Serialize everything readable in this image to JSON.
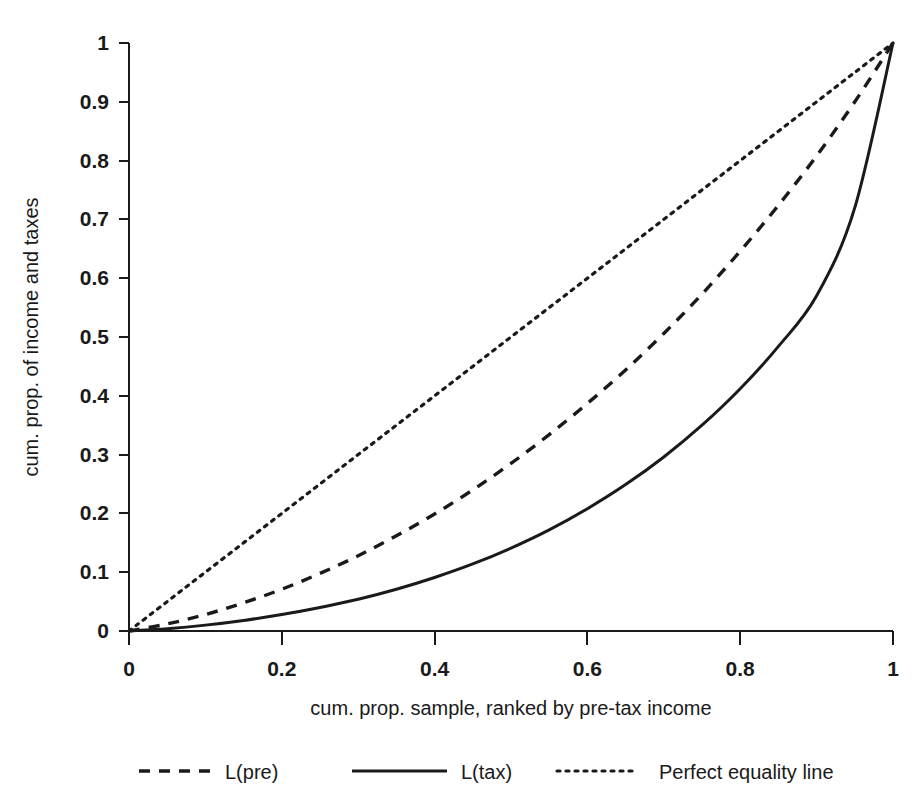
{
  "chart_data": {
    "type": "line",
    "title": "",
    "subtitle": "",
    "xlabel": "cum. prop. sample, ranked by pre-tax income",
    "ylabel": "cum. prop. of income and taxes",
    "xlim": [
      0,
      1
    ],
    "ylim": [
      0,
      1
    ],
    "grid": false,
    "legend_position": "bottom",
    "xticks": [
      "0",
      "0.2",
      "0.4",
      "0.6",
      "0.8",
      "1"
    ],
    "xtick_values": [
      0,
      0.2,
      0.4,
      0.6,
      0.8,
      1
    ],
    "yticks": [
      "0",
      "0.1",
      "0.2",
      "0.3",
      "0.4",
      "0.5",
      "0.6",
      "0.7",
      "0.8",
      "0.9",
      "1"
    ],
    "ytick_values": [
      0,
      0.1,
      0.2,
      0.3,
      0.4,
      0.5,
      0.6,
      0.7,
      0.8,
      0.9,
      1
    ],
    "x": [
      0,
      0.05,
      0.1,
      0.15,
      0.2,
      0.25,
      0.3,
      0.35,
      0.4,
      0.45,
      0.5,
      0.55,
      0.6,
      0.65,
      0.7,
      0.75,
      0.8,
      0.85,
      0.9,
      0.95,
      1
    ],
    "series": [
      {
        "name": "L(pre)",
        "style": "dashed",
        "color": "#1a1a1a",
        "values": [
          0,
          0.012,
          0.028,
          0.048,
          0.071,
          0.098,
          0.128,
          0.162,
          0.199,
          0.24,
          0.285,
          0.334,
          0.387,
          0.444,
          0.506,
          0.573,
          0.646,
          0.724,
          0.808,
          0.9,
          1
        ]
      },
      {
        "name": "L(tax)",
        "style": "solid",
        "color": "#1a1a1a",
        "values": [
          0,
          0.004,
          0.01,
          0.018,
          0.028,
          0.04,
          0.054,
          0.071,
          0.091,
          0.114,
          0.141,
          0.172,
          0.208,
          0.249,
          0.296,
          0.35,
          0.412,
          0.484,
          0.57,
          0.72,
          1
        ]
      },
      {
        "name": "Perfect equality line",
        "style": "dotted",
        "color": "#1a1a1a",
        "values": [
          0,
          0.05,
          0.1,
          0.15,
          0.2,
          0.25,
          0.3,
          0.35,
          0.4,
          0.45,
          0.5,
          0.55,
          0.6,
          0.65,
          0.7,
          0.75,
          0.8,
          0.85,
          0.9,
          0.95,
          1
        ]
      }
    ]
  },
  "legend": {
    "items": [
      {
        "label": "L(pre)",
        "style": "dashed"
      },
      {
        "label": "L(tax)",
        "style": "solid"
      },
      {
        "label": "Perfect equality line",
        "style": "dotted"
      }
    ]
  }
}
